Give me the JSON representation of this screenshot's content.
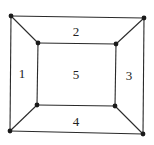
{
  "diagram": {
    "type": "planar-graph",
    "colors": {
      "edge": "#2a2a2a",
      "vertex": "#1a1a1a",
      "label": "#222222",
      "background": "#ffffff"
    },
    "vertices": [
      {
        "id": "outer-top-left",
        "x": 11,
        "y": 16
      },
      {
        "id": "outer-top-right",
        "x": 144,
        "y": 18
      },
      {
        "id": "outer-bottom-right",
        "x": 143,
        "y": 134
      },
      {
        "id": "outer-bottom-left",
        "x": 10,
        "y": 131
      },
      {
        "id": "inner-top-left",
        "x": 38,
        "y": 43
      },
      {
        "id": "inner-top-right",
        "x": 116,
        "y": 44
      },
      {
        "id": "inner-bottom-right",
        "x": 115,
        "y": 106
      },
      {
        "id": "inner-bottom-left",
        "x": 37,
        "y": 105
      }
    ],
    "edges": [
      [
        "outer-top-left",
        "outer-top-right"
      ],
      [
        "outer-top-right",
        "outer-bottom-right"
      ],
      [
        "outer-bottom-right",
        "outer-bottom-left"
      ],
      [
        "outer-bottom-left",
        "outer-top-left"
      ],
      [
        "inner-top-left",
        "inner-top-right"
      ],
      [
        "inner-top-right",
        "inner-bottom-right"
      ],
      [
        "inner-bottom-right",
        "inner-bottom-left"
      ],
      [
        "inner-bottom-left",
        "inner-top-left"
      ],
      [
        "outer-top-left",
        "inner-top-left"
      ],
      [
        "outer-top-right",
        "inner-top-right"
      ],
      [
        "outer-bottom-right",
        "inner-bottom-right"
      ],
      [
        "outer-bottom-left",
        "inner-bottom-left"
      ]
    ],
    "regions": [
      {
        "label": "1",
        "x": 22,
        "y": 73
      },
      {
        "label": "2",
        "x": 76,
        "y": 31
      },
      {
        "label": "3",
        "x": 129,
        "y": 75
      },
      {
        "label": "4",
        "x": 76,
        "y": 121
      },
      {
        "label": "5",
        "x": 76,
        "y": 74
      }
    ]
  }
}
